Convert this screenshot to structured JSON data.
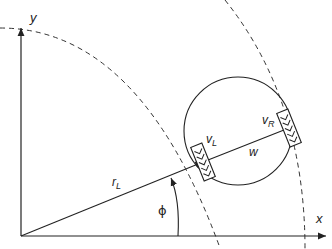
{
  "diagram": {
    "type": "differential-drive-robot-kinematics",
    "axes": {
      "x_label": "x",
      "y_label": "y"
    },
    "labels": {
      "left_wheel_velocity": "v",
      "left_sub": "L",
      "right_wheel_velocity": "v",
      "right_sub": "R",
      "wheel_base": "w",
      "left_radius": "r",
      "left_radius_sub": "L",
      "angle": "ϕ"
    },
    "colors": {
      "stroke": "#222222",
      "background": "#ffffff"
    }
  }
}
